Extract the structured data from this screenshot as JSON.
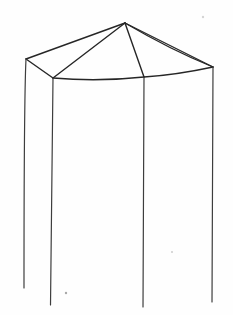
{
  "figure": {
    "background_color": "#fefefe",
    "canvas": {
      "width": 233,
      "height": 315
    },
    "default_stroke": "#2f2f2f",
    "vertices": {
      "apex": [
        125,
        23
      ],
      "rim_back_left": [
        26,
        59
      ],
      "rim_front_left": [
        53,
        78
      ],
      "rim_front_right": [
        144,
        77
      ],
      "rim_right": [
        213,
        67
      ],
      "bottom_back_left": [
        24,
        288
      ],
      "bottom_front_left": [
        50.5,
        305
      ],
      "bottom_front_right": [
        143,
        307
      ],
      "bottom_right": [
        212,
        302
      ]
    },
    "paths": [
      {
        "name": "roof-edge-apex-to-back-left",
        "d": "M125,23 L26,59",
        "stroke": "#262626",
        "width": 1.4
      },
      {
        "name": "roof-edge-apex-to-front-left",
        "d": "M125,23 L53,78",
        "stroke": "#262626",
        "width": 1.4
      },
      {
        "name": "roof-edge-apex-to-front-right",
        "d": "M125,23 L144,77",
        "stroke": "#262626",
        "width": 1.4
      },
      {
        "name": "roof-edge-apex-to-right-upper",
        "d": "M125,23 L213,67",
        "stroke": "#262626",
        "width": 1.3
      },
      {
        "name": "roof-edge-apex-to-right-lower",
        "d": "M125,23 Q171,50 213,67",
        "stroke": "#262626",
        "width": 1.3
      },
      {
        "name": "rim-edge-back-left-to-front-left",
        "d": "M26,59 L53,78",
        "stroke": "#262626",
        "width": 1.4
      },
      {
        "name": "rim-edge-front-left-to-front-right",
        "d": "M53,78 Q98,82 144,77",
        "stroke": "#262626",
        "width": 1.4
      },
      {
        "name": "rim-edge-front-right-to-right",
        "d": "M144,77 Q176,75 213,67",
        "stroke": "#262626",
        "width": 1.4
      },
      {
        "name": "prism-edge-back-left",
        "d": "M26,59 Q24,100 24,288",
        "stroke": "#3d3d3d",
        "width": 1.2
      },
      {
        "name": "prism-edge-front-left",
        "d": "M53,78 Q52,190 50.5,305",
        "stroke": "#3d3d3d",
        "width": 1.2
      },
      {
        "name": "prism-edge-front-right",
        "d": "M144,77 Q143,200 143,307",
        "stroke": "#3d3d3d",
        "width": 1.2
      },
      {
        "name": "prism-edge-right",
        "d": "M213,67 Q212,180 212,302",
        "stroke": "#3d3d3d",
        "width": 1.2
      }
    ],
    "paper_specks": [
      {
        "name": "speck-bottom-left",
        "x": 66,
        "y": 293,
        "r": 1.2,
        "color": "#a8a8a8"
      },
      {
        "name": "speck-mid-right",
        "x": 172,
        "y": 252,
        "r": 1.0,
        "color": "#cccccc"
      },
      {
        "name": "speck-top-right",
        "x": 203,
        "y": 17,
        "r": 1.2,
        "color": "#d4d4d4"
      }
    ]
  }
}
